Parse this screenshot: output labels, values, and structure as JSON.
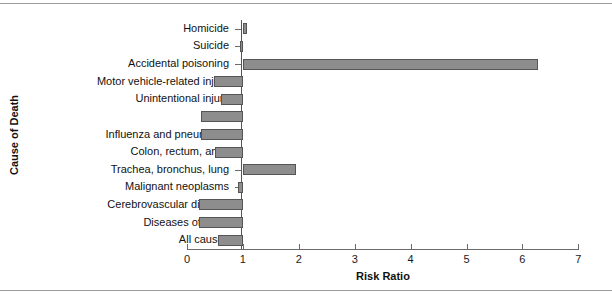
{
  "chart_data": {
    "type": "bar",
    "orientation": "horizontal",
    "title": "",
    "xlabel": "Risk Ratio",
    "ylabel": "Cause of Death",
    "reference_line": 1,
    "xlim": [
      0,
      7
    ],
    "xticks": [
      0,
      1,
      2,
      3,
      4,
      5,
      6,
      7
    ],
    "xticklabels": [
      "0",
      "1",
      "2",
      "3",
      "4",
      "5",
      "6",
      "7"
    ],
    "grid": false,
    "legend": "none",
    "bar_color": "#8d8d8d",
    "bar_edge_color": "#555555",
    "categories": [
      "Homicide",
      "Suicide",
      "Accidental poisoning",
      "Motor vehicle-related injury",
      "Unintentional injury",
      "HIV",
      "Influenza and pneumonia",
      "Colon, rectum, anus",
      "Trachea, bronchus, lung",
      "Malignant neoplasms",
      "Cerebrovascular disease",
      "Diseases of heart",
      "All causes"
    ],
    "values": [
      1.07,
      0.95,
      6.28,
      0.48,
      0.6,
      0.25,
      0.25,
      0.5,
      1.95,
      0.92,
      0.21,
      0.22,
      0.55
    ]
  }
}
